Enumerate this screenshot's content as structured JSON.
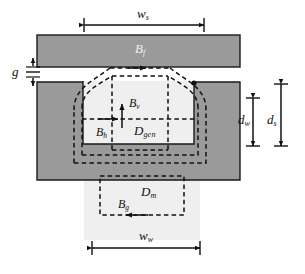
{
  "figure": {
    "kind": "magnetic-core-cross-section-diagram",
    "background_color": "#ffffff",
    "core_fill_color": "#9a9a9a",
    "core_stroke_color": "#1a1a1a",
    "gap_shade_color": "#ededed",
    "flux_line_color": "#111111"
  },
  "dimensions": {
    "top_width": {
      "symbol": "w",
      "subscript": "s",
      "name": "slider-width"
    },
    "bottom_width": {
      "symbol": "w",
      "subscript": "w",
      "name": "winding-width"
    },
    "gap": {
      "symbol": "g",
      "subscript": "",
      "name": "air-gap"
    },
    "inner_depth": {
      "symbol": "d",
      "subscript": "w",
      "name": "winding-depth"
    },
    "outer_depth": {
      "symbol": "d",
      "subscript": "s",
      "name": "slot-depth"
    }
  },
  "flux_labels": {
    "top_yoke": {
      "symbol": "B",
      "subscript": "f",
      "name": "flux-density-fringing"
    },
    "vertical": {
      "symbol": "B",
      "subscript": "v",
      "name": "flux-density-vertical"
    },
    "horizontal": {
      "symbol": "B",
      "subscript": "h",
      "name": "flux-density-horizontal"
    },
    "bottom": {
      "symbol": "B",
      "subscript": "g",
      "name": "flux-density-gap"
    }
  },
  "region_labels": {
    "generator_region": {
      "symbol": "D",
      "subscript": "gen",
      "name": "generator-domain"
    },
    "machine_region": {
      "symbol": "D",
      "subscript": "m",
      "name": "magnet-domain"
    }
  }
}
